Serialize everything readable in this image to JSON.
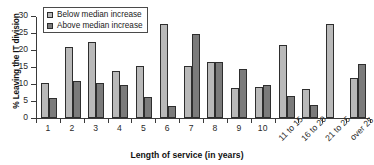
{
  "chart_data": {
    "type": "bar",
    "title": "",
    "xlabel": "Length of service (in years)",
    "ylabel": "% Leaving the IT division",
    "ylim": [
      0,
      30
    ],
    "yticks": [
      0,
      5,
      10,
      15,
      20,
      25,
      30
    ],
    "grid": false,
    "legend_position": "top-left",
    "categories": [
      "1",
      "2",
      "3",
      "4",
      "5",
      "6",
      "7",
      "8",
      "9",
      "10",
      "11 to 15",
      "16 to 20",
      "21 to 25",
      "over 25"
    ],
    "series": [
      {
        "name": "Below median increase",
        "color": "#b9b9b9",
        "values": [
          10.2,
          21.0,
          22.3,
          13.7,
          15.3,
          27.7,
          15.2,
          16.6,
          8.8,
          9.2,
          21.5,
          8.4,
          27.7,
          11.7
        ]
      },
      {
        "name": "Above median increase",
        "color": "#7b7b7b",
        "values": [
          5.9,
          11.0,
          10.2,
          9.8,
          6.3,
          3.5,
          24.7,
          16.6,
          14.3,
          9.8,
          6.4,
          3.9,
          0,
          15.8
        ]
      }
    ]
  },
  "legend": {
    "items": [
      {
        "label": "Below median increase",
        "swatch": "below"
      },
      {
        "label": "Above median increase",
        "swatch": "above"
      }
    ]
  }
}
